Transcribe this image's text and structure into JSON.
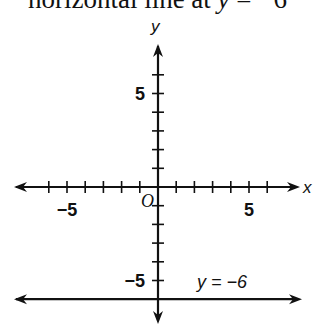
{
  "caption": {
    "prefix": "horizontal line at ",
    "var": "y",
    "suffix": " = −6"
  },
  "chart_data": {
    "type": "line",
    "title": "horizontal line at y = −6",
    "xlabel": "x",
    "ylabel": "y",
    "origin_label": "O",
    "x_ticks": [
      -6,
      -5,
      -4,
      -3,
      -2,
      -1,
      1,
      2,
      3,
      4,
      5,
      6
    ],
    "y_ticks": [
      -6,
      -5,
      -4,
      -3,
      -2,
      -1,
      1,
      2,
      3,
      4,
      5,
      6
    ],
    "x_tick_labels": [
      "−5",
      "5"
    ],
    "y_tick_labels": [
      "5",
      "−5"
    ],
    "xlim": [
      -8,
      8
    ],
    "ylim": [
      -7,
      8
    ],
    "grid": false,
    "series": [
      {
        "name": "y = −6",
        "type": "horizontal-line",
        "y": -6,
        "x": [
          -8,
          8
        ],
        "values": [
          -6,
          -6
        ]
      }
    ],
    "annotations": [
      {
        "text": "y = −6",
        "x": 2.5,
        "y": -5.5
      }
    ],
    "color": "#111111"
  }
}
